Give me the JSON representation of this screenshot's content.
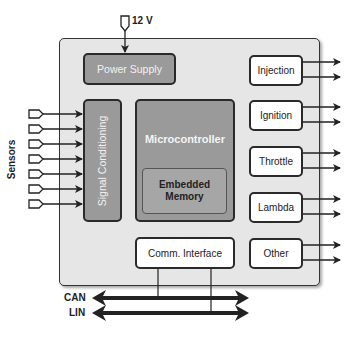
{
  "power": {
    "label": "12 V"
  },
  "blocks": {
    "power_supply": "Power Supply",
    "signal_conditioning": "Signal Conditioning",
    "microcontroller": "Microcontroller",
    "embedded_memory_line1": "Embedded",
    "embedded_memory_line2": "Memory",
    "comm_interface": "Comm. Interface"
  },
  "outputs": [
    "Injection",
    "Ignition",
    "Throttle",
    "Lambda",
    "Other"
  ],
  "inputs": {
    "label": "Sensors",
    "count": 7
  },
  "buses": [
    "CAN",
    "LIN"
  ]
}
